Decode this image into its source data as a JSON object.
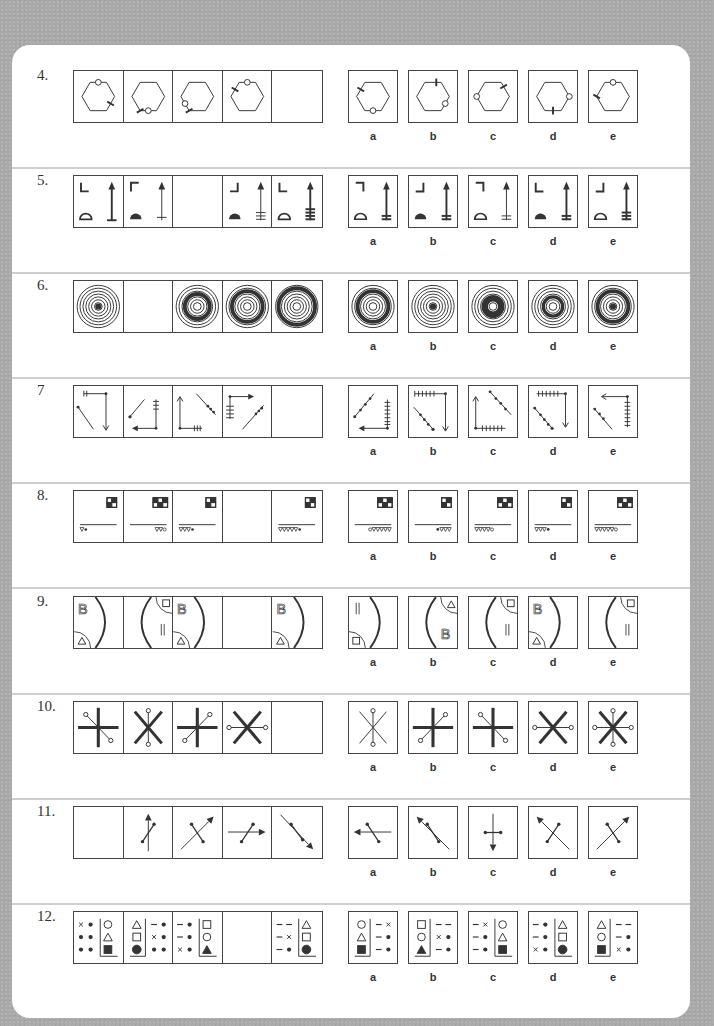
{
  "page": {
    "background": "#a9a9a9",
    "card_color": "#ffffff"
  },
  "option_letters": [
    "a",
    "b",
    "c",
    "d",
    "e"
  ],
  "questions": [
    {
      "number": "4.",
      "type": "hexagon",
      "sequence": [
        {
          "circle": 0,
          "tick": 2
        },
        {
          "circle": 3,
          "tick": 3.5
        },
        {
          "circle": 4,
          "tick": 3.5
        },
        {
          "circle": 0,
          "tick": 5
        },
        null
      ],
      "options": [
        {
          "circle": 3,
          "tick": 5
        },
        {
          "circle": 2,
          "tick": 0.2
        },
        {
          "circle": 4.5,
          "tick": 0.8
        },
        {
          "circle": 1.5,
          "tick": 3
        },
        {
          "circle": 6,
          "tick": 4.5
        }
      ]
    },
    {
      "number": "5.",
      "type": "corner_arrow",
      "sequence": [
        {
          "corner": "L",
          "dome": "open",
          "bars": 0,
          "base": true,
          "thick": true
        },
        {
          "corner": "Γ",
          "dome": "filled",
          "bars": 1,
          "thick": false
        },
        null,
        {
          "corner": "J",
          "dome": "filled",
          "bars": 3,
          "thick": false
        },
        {
          "corner": "L",
          "dome": "open",
          "bars": 4,
          "thick": true
        }
      ],
      "options": [
        {
          "corner": "7",
          "dome": "open",
          "bars": 2,
          "thick": true
        },
        {
          "corner": "J",
          "dome": "filled",
          "bars": 2,
          "thick": true
        },
        {
          "corner": "7",
          "dome": "open",
          "bars": 2,
          "thick": false
        },
        {
          "corner": "L",
          "dome": "filled",
          "bars": 2,
          "thick": true
        },
        {
          "corner": "J",
          "dome": "open",
          "bars": 3,
          "thick": true
        }
      ]
    },
    {
      "number": "6.",
      "type": "rings",
      "sequence": [
        {
          "thick": -1,
          "dot": true
        },
        null,
        {
          "thick": 1,
          "dot": false
        },
        {
          "thick": 2,
          "dot": false
        },
        {
          "thick": 3,
          "dot": false
        }
      ],
      "options": [
        {
          "thick": 2,
          "dot": false
        },
        {
          "thick": -1,
          "dot": true
        },
        {
          "thick": 0,
          "dot": false,
          "innerThick": true
        },
        {
          "thick": 0,
          "dot": false,
          "innerThick": true,
          "bigger": true
        },
        {
          "thick": 2,
          "dot": true
        }
      ]
    },
    {
      "number": "7",
      "type": "lines7",
      "sequence": [
        "s1",
        "s2",
        "s3",
        "s4",
        null
      ],
      "options": [
        "oa",
        "ob",
        "oc",
        "od",
        "oe"
      ]
    },
    {
      "number": "8.",
      "type": "checker",
      "sequence": [
        {
          "grid": 2,
          "tri": 1,
          "mark": "dot",
          "side": "left"
        },
        {
          "grid": 3,
          "tri": 2,
          "mark": "ring",
          "side": "right"
        },
        {
          "grid": 2,
          "tri": 3,
          "mark": "dot",
          "side": "left"
        },
        null,
        {
          "grid": 2,
          "tri": 5,
          "mark": "dot",
          "side": "left"
        }
      ],
      "options": [
        {
          "grid": 3,
          "tri": 5,
          "mark": "ring",
          "side": "right",
          "markFirst": true
        },
        {
          "grid": 2,
          "tri": 3,
          "mark": "dot",
          "side": "right",
          "markFirst": true
        },
        {
          "grid": 3,
          "tri": 4,
          "mark": "ring",
          "side": "left"
        },
        {
          "grid": 2,
          "tri": 3,
          "mark": "dot",
          "side": "left"
        },
        {
          "grid": 3,
          "tri": 5,
          "mark": "ring",
          "side": "left"
        }
      ]
    },
    {
      "number": "9.",
      "type": "arc",
      "sequence": [
        {
          "arc": "right",
          "letter": "B",
          "corner": "bl",
          "cornerShape": "tri"
        },
        {
          "arc": "left",
          "letter": "||",
          "corner": "tr",
          "cornerShape": "sq"
        },
        {
          "arc": "right",
          "letter": "B",
          "corner": "bl",
          "cornerShape": "tri"
        },
        null,
        {
          "arc": "right",
          "letter": "B",
          "corner": "bl",
          "cornerShape": "tri"
        }
      ],
      "options": [
        {
          "arc": "right",
          "letter": "||",
          "corner": "bl",
          "cornerShape": "sq"
        },
        {
          "arc": "left",
          "letter": "B",
          "corner": "tr",
          "cornerShape": "tri"
        },
        {
          "arc": "left",
          "letter": "||",
          "corner": "tr",
          "cornerShape": "sq"
        },
        {
          "arc": "right",
          "letter": "B",
          "corner": "bl",
          "cornerShape": "tri"
        },
        {
          "arc": "left",
          "letter": "||",
          "corner": "tr",
          "cornerShape": "sq"
        }
      ]
    },
    {
      "number": "10.",
      "type": "star",
      "sequence": [
        {
          "bold": "plus",
          "thin": "diag-nw"
        },
        {
          "bold": "x",
          "thin": "vert"
        },
        {
          "bold": "plus",
          "thin": "diag-ne"
        },
        {
          "bold": "x",
          "thin": "horiz"
        },
        null
      ],
      "options": [
        {
          "bold": "none",
          "thinX": true,
          "thin": "vert"
        },
        {
          "bold": "plus",
          "thin": "diag-ne"
        },
        {
          "bold": "plus",
          "thin": "diag-nw"
        },
        {
          "bold": "x",
          "thin": "horiz"
        },
        {
          "bold": "x",
          "thin": "both"
        }
      ]
    },
    {
      "number": "11.",
      "type": "arrows",
      "sequence": [
        null,
        {
          "arrow": "up",
          "seg": "ne"
        },
        {
          "arrow": "ne",
          "seg": "nw"
        },
        {
          "arrow": "right",
          "seg": "ne"
        },
        {
          "arrow": "se",
          "seg": "se"
        }
      ],
      "options": [
        {
          "arrow": "left",
          "seg": "nw"
        },
        {
          "arrow": "nw",
          "seg": "nw"
        },
        {
          "arrow": "down",
          "seg": "horiz"
        },
        {
          "arrow": "nw",
          "seg": "ne"
        },
        {
          "arrow": "ne",
          "seg": "nw"
        }
      ]
    },
    {
      "number": "12.",
      "type": "symbols",
      "sequence": [
        {
          "left": [
            [
              "x",
              "•"
            ],
            [
              "•",
              "•"
            ],
            [
              "•",
              "•"
            ]
          ],
          "shapes": [
            "circle",
            "triangle",
            "square-f"
          ],
          "shapesSide": "right"
        },
        {
          "left": [
            [
              "–",
              "•"
            ],
            [
              "x",
              "•"
            ],
            [
              "•",
              "•"
            ]
          ],
          "shapes": [
            "triangle",
            "square",
            "circle-f"
          ],
          "shapesSide": "left"
        },
        {
          "left": [
            [
              "–",
              "•"
            ],
            [
              "–",
              "•"
            ],
            [
              "x",
              "•"
            ]
          ],
          "shapes": [
            "square",
            "circle",
            "triangle-f"
          ],
          "shapesSide": "right"
        },
        null,
        {
          "left": [
            [
              "–",
              "–"
            ],
            [
              "–",
              "x"
            ],
            [
              "–",
              "•"
            ]
          ],
          "shapes": [
            "triangle",
            "square",
            "circle-f"
          ],
          "shapesSide": "right"
        }
      ],
      "options": [
        {
          "left": [
            [
              "–",
              "x"
            ],
            [
              "–",
              "•"
            ],
            [
              "–",
              "•"
            ]
          ],
          "shapes": [
            "circle",
            "triangle",
            "square-f"
          ],
          "shapesSide": "left"
        },
        {
          "left": [
            [
              "–",
              "–"
            ],
            [
              "x",
              "•"
            ],
            [
              "–",
              "•"
            ]
          ],
          "shapes": [
            "square",
            "circle",
            "triangle-f"
          ],
          "shapesSide": "left"
        },
        {
          "left": [
            [
              "–",
              "x"
            ],
            [
              "–",
              "•"
            ],
            [
              "–",
              "•"
            ]
          ],
          "shapes": [
            "circle",
            "triangle",
            "square-f"
          ],
          "shapesSide": "right"
        },
        {
          "left": [
            [
              "–",
              "•"
            ],
            [
              "–",
              "•"
            ],
            [
              "x",
              "•"
            ]
          ],
          "shapes": [
            "triangle",
            "square",
            "circle-f"
          ],
          "shapesSide": "right"
        },
        {
          "left": [
            [
              "–",
              "–"
            ],
            [
              "–",
              "•"
            ],
            [
              "x",
              "•"
            ]
          ],
          "shapes": [
            "triangle",
            "circle",
            "square-f"
          ],
          "shapesSide": "left"
        }
      ]
    }
  ]
}
